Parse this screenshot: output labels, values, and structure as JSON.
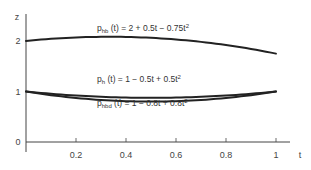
{
  "chart_data": {
    "type": "line",
    "title": "",
    "xlabel": "t",
    "ylabel": "z",
    "xlim": [
      0,
      1
    ],
    "ylim": [
      0,
      2.2
    ],
    "grid": false,
    "x_ticks": [
      0.2,
      0.4,
      0.6,
      0.8,
      1
    ],
    "x_tick_labels": [
      "0.2",
      "0.4",
      "0.6",
      "0.8",
      "1"
    ],
    "y_ticks": [
      0,
      1,
      2
    ],
    "y_tick_labels": [
      "0",
      "1",
      "2"
    ],
    "series": [
      {
        "name": "p_hb(t)",
        "label_main": "p",
        "label_sub": "hb",
        "label_rest": " (t) = 2 + 0.5t − 0.75t",
        "label_sup": "2",
        "coefficients": [
          2,
          0.5,
          -0.75
        ],
        "x": [
          0,
          0.1,
          0.2,
          0.3,
          0.4,
          0.5,
          0.6,
          0.7,
          0.8,
          0.9,
          1.0
        ],
        "values": [
          2.0,
          2.0425,
          2.07,
          2.0825,
          2.08,
          2.0625,
          2.03,
          1.9825,
          1.92,
          1.8425,
          1.75
        ]
      },
      {
        "name": "p_h(t)",
        "label_main": "p",
        "label_sub": "h",
        "label_rest": " (t) = 1 − 0.5t + 0.5t",
        "label_sup": "2",
        "coefficients": [
          1,
          -0.5,
          0.5
        ],
        "x": [
          0,
          0.1,
          0.2,
          0.3,
          0.4,
          0.5,
          0.6,
          0.7,
          0.8,
          0.9,
          1.0
        ],
        "values": [
          1.0,
          0.955,
          0.92,
          0.895,
          0.88,
          0.875,
          0.88,
          0.895,
          0.92,
          0.955,
          1.0
        ]
      },
      {
        "name": "p_hbd(t)",
        "label_main": "p",
        "label_sub": "hbd",
        "label_rest": " (t) = 1 − 0.8t + 0.8t",
        "label_sup": "2",
        "coefficients": [
          1,
          -0.8,
          0.8
        ],
        "x": [
          0,
          0.1,
          0.2,
          0.3,
          0.4,
          0.5,
          0.6,
          0.7,
          0.8,
          0.9,
          1.0
        ],
        "values": [
          1.0,
          0.928,
          0.872,
          0.832,
          0.808,
          0.8,
          0.808,
          0.832,
          0.872,
          0.928,
          1.0
        ]
      }
    ],
    "annotations": [
      "p_hb (t) = 2 + 0.5t − 0.75t²",
      "p_h (t) = 1 − 0.5t + 0.5t²",
      "p_hbd (t) = 1 − 0.8t + 0.8t²"
    ],
    "colors": {
      "curve": "#222222",
      "axis": "#444444",
      "text": "#333333"
    }
  }
}
